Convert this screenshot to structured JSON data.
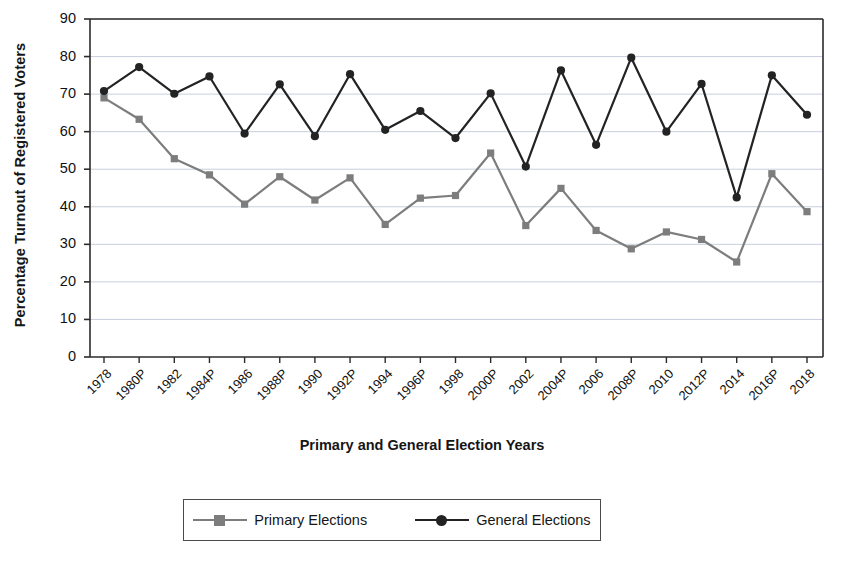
{
  "chart_data": {
    "type": "line",
    "title": "",
    "xlabel": "Primary and General Election Years",
    "ylabel": "Percentage Turnout of Registered Voters",
    "ylim": [
      0,
      90
    ],
    "ytick_step": 10,
    "yticks": [
      0,
      10,
      20,
      30,
      40,
      50,
      60,
      70,
      80,
      90
    ],
    "grid": true,
    "legend_position": "below",
    "categories": [
      "1978",
      "1980P",
      "1982",
      "1984P",
      "1986",
      "1988P",
      "1990",
      "1992P",
      "1994",
      "1996P",
      "1998",
      "2000P",
      "2002",
      "2004P",
      "2006",
      "2008P",
      "2010",
      "2012P",
      "2014",
      "2016P",
      "2018"
    ],
    "series": [
      {
        "name": "Primary Elections",
        "color": "#7d7d7d",
        "marker": "square",
        "values": [
          69.0,
          63.3,
          52.8,
          48.5,
          40.7,
          48.0,
          41.8,
          47.7,
          35.3,
          42.3,
          43.0,
          54.3,
          35.0,
          44.9,
          33.7,
          28.8,
          33.3,
          31.3,
          25.3,
          48.8,
          38.7
        ]
      },
      {
        "name": "General Elections",
        "color": "#232323",
        "marker": "circle",
        "values": [
          70.8,
          77.2,
          70.1,
          74.7,
          59.5,
          72.6,
          58.8,
          75.3,
          60.5,
          65.5,
          58.3,
          70.2,
          50.7,
          76.3,
          56.5,
          79.7,
          60.0,
          72.7,
          42.5,
          75.0,
          64.5
        ]
      }
    ]
  },
  "legend": {
    "entries": [
      {
        "label": "Primary Elections"
      },
      {
        "label": "General Elections"
      }
    ]
  }
}
